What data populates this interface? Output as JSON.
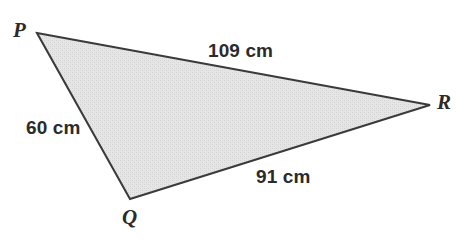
{
  "figure": {
    "kind": "geometry-diagram",
    "shape": "triangle",
    "name": "Triangle PQR",
    "background_color": "#ffffff"
  },
  "style": {
    "fill_color": "#e2e2e2",
    "fill_texture": "halftone-dither",
    "stroke_color": "#3a3a3a",
    "stroke_width": 2,
    "label_color": "#2b2b2b"
  },
  "vertices": [
    {
      "id": "P",
      "label": "P",
      "x": 37,
      "y": 33,
      "label_x": 13,
      "label_y": 20
    },
    {
      "id": "Q",
      "label": "Q",
      "x": 130,
      "y": 199,
      "label_x": 122,
      "label_y": 207
    },
    {
      "id": "R",
      "label": "R",
      "x": 430,
      "y": 105,
      "label_x": 437,
      "label_y": 92
    }
  ],
  "sides": [
    {
      "id": "PR",
      "from": "P",
      "to": "R",
      "label": "109 cm",
      "value": 109,
      "unit": "cm",
      "label_x": 208,
      "label_y": 41
    },
    {
      "id": "PQ",
      "from": "P",
      "to": "Q",
      "label": "60 cm",
      "value": 60,
      "unit": "cm",
      "label_x": 26,
      "label_y": 118
    },
    {
      "id": "QR",
      "from": "Q",
      "to": "R",
      "label": "91 cm",
      "value": 91,
      "unit": "cm",
      "label_x": 256,
      "label_y": 167
    }
  ],
  "polygon_points": "37,33 430,105 130,199"
}
